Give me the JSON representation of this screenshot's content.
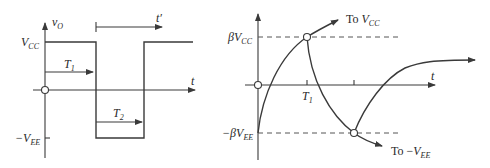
{
  "left_plot": {
    "y_label": "v",
    "y_label_sub": "O",
    "x_label": "t",
    "shifted_time_label": "t′",
    "level_high": {
      "main": "V",
      "sub": "CC"
    },
    "level_low": {
      "main": "−V",
      "sub": "EE"
    },
    "interval_1": {
      "main": "T",
      "sub": "1"
    },
    "interval_2": {
      "main": "T",
      "sub": "2"
    }
  },
  "right_plot": {
    "x_label": "t",
    "level_high": {
      "prefix": "β",
      "main": "V",
      "sub": "CC"
    },
    "level_low": {
      "prefix": "−β",
      "main": "V",
      "sub": "EE"
    },
    "tick_1": {
      "main": "T",
      "sub": "1"
    },
    "asymptote_up": {
      "to": "To ",
      "main": "V",
      "sub": "CC"
    },
    "asymptote_down": {
      "to": "To −",
      "main": "V",
      "sub": "EE"
    }
  },
  "colors": {
    "stroke": "#3a3a3a",
    "background": "#ffffff"
  }
}
